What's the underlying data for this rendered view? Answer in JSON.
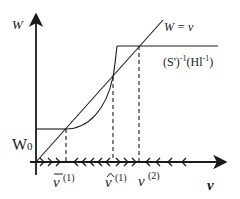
{
  "diagram": {
    "axes": {
      "y_label": "W",
      "x_label": "v",
      "w0_label": "W",
      "w0_sub": "0"
    },
    "curves": {
      "diagonal_label": "W = v",
      "plateau_label_main": "(S')",
      "plateau_label_exp1": "-1",
      "plateau_label_arg": "(Hl",
      "plateau_label_exp2": "-1",
      "plateau_label_close": ")"
    },
    "x_markers": [
      {
        "symbol": "v",
        "accent": "bar",
        "superscript": "(1)"
      },
      {
        "symbol": "v",
        "accent": "hat",
        "superscript": "(1)"
      },
      {
        "symbol": "v",
        "accent": "none",
        "superscript": "(2)"
      }
    ],
    "flow_arrows": [
      {
        "segment": "0 to v̄(1)",
        "direction": "right",
        "count": 3
      },
      {
        "segment": "v̄(1) to v̂(1)",
        "direction": "left",
        "count": 5
      },
      {
        "segment": "v̂(1) to v(2)",
        "direction": "right",
        "count": 3
      },
      {
        "segment": "beyond v(2)",
        "direction": "left",
        "count": 4
      }
    ],
    "colors": {
      "line": "#1a1a1a",
      "background": "#ffffff"
    }
  }
}
